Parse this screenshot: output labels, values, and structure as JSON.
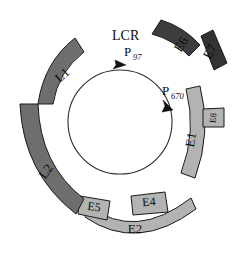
{
  "figure": {
    "type": "genome-map",
    "title_label": "LCR",
    "background_color": "#ffffff",
    "center": {
      "x": 120,
      "y": 122
    },
    "backbone_radius": 52
  },
  "palette": {
    "dark_gene": "#3d3d3d",
    "darker_gene": "#333333",
    "mid_gene": "#6e6e6e",
    "light_gene": "#b3b3b3",
    "outline": "#1a1a1a",
    "text": "#0d0d0d",
    "backbone": "#2b2b2b"
  },
  "regions": {
    "lcr": {
      "label": "LCR",
      "x": 112,
      "y": 34,
      "font_size": 14
    }
  },
  "promoters": [
    {
      "name": "P97",
      "base": "P",
      "subscript": "97",
      "label_x": 126,
      "label_y": 55,
      "sub_x": 136,
      "sub_y": 59,
      "arrow_x": 118,
      "arrow_y": 70,
      "arrow_rotation": 20
    },
    {
      "name": "P670",
      "base": "P",
      "subscript": "670",
      "label_x": 165,
      "label_y": 92,
      "sub_x": 174,
      "sub_y": 96,
      "arrow_x": 167,
      "arrow_y": 108,
      "arrow_rotation": 115
    }
  ],
  "genes": [
    {
      "id": "E6",
      "label": "E6",
      "shade": "dark",
      "fill": "#3d3d3d",
      "label_x": 182,
      "label_y": 45,
      "label_rotation": -58,
      "font_size": 13,
      "path": "M 152 34 L 161 20 Q 184 27 200 45 L 189 56 Q 174 40 152 34 Z"
    },
    {
      "id": "E7",
      "label": "E7",
      "shade": "darker",
      "fill": "#333333",
      "label_x": 211,
      "label_y": 58,
      "label_rotation": -62,
      "font_size": 13,
      "path": "M 201 36 L 213 30 L 227 63 L 214 70 Z"
    },
    {
      "id": "E1",
      "label": "E1",
      "shade": "light",
      "fill": "#b3b3b3",
      "label_x": 194,
      "label_y": 138,
      "label_rotation": -80,
      "font_size": 13,
      "path": "M 186 89 L 200 86 Q 212 132 195 178 L 181 173 Q 197 131 186 89 Z"
    },
    {
      "id": "E8",
      "label": "E8",
      "shade": "light",
      "fill": "#b3b3b3",
      "label_x": 214,
      "label_y": 118,
      "label_rotation": -85,
      "font_size": 9,
      "path": "M 203 109 L 224 108 L 224 127 L 203 127 Z"
    },
    {
      "id": "E2",
      "label": "E2",
      "shade": "light",
      "fill": "#b3b3b3",
      "label_x": 132,
      "label_y": 228,
      "label_rotation": 0,
      "font_size": 13,
      "path": "M 89 206 Q 135 241 191 198 L 196 209 Q 137 253 85 217 Z"
    },
    {
      "id": "E4",
      "label": "E4",
      "shade": "light",
      "fill": "#b3b3b3",
      "label_x": 148,
      "label_y": 204,
      "label_rotation": -5,
      "font_size": 12,
      "path": "M 131 196 L 165 192 L 168 212 L 133 215 Z"
    },
    {
      "id": "E5",
      "label": "E5",
      "shade": "light",
      "fill": "#b3b3b3",
      "label_x": 95,
      "label_y": 206,
      "label_rotation": 8,
      "font_size": 12,
      "path": "M 80 196 L 110 201 L 107 220 L 78 214 Z"
    },
    {
      "id": "L2",
      "label": "L2",
      "shade": "mid",
      "fill": "#6e6e6e",
      "label_x": 50,
      "label_y": 172,
      "label_rotation": -55,
      "font_size": 13,
      "path": "M 20 104 L 38 104 Q 40 165 84 199 L 76 214 Q 23 173 20 104 Z"
    },
    {
      "id": "L1",
      "label": "L1",
      "shade": "mid",
      "fill": "#6e6e6e",
      "label_x": 62,
      "label_y": 75,
      "label_rotation": -38,
      "font_size": 13,
      "path": "M 38 104 Q 44 62 75 38 L 84 52 Q 58 72 53 104 Z"
    }
  ]
}
